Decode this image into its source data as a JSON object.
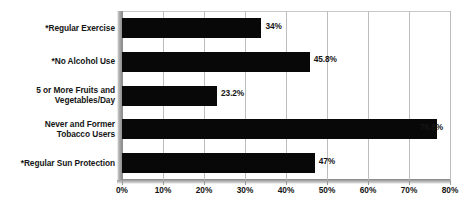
{
  "chart_data": {
    "type": "bar",
    "orientation": "horizontal",
    "title": "",
    "subtitle": "",
    "xlabel": "",
    "ylabel": "",
    "xlim": [
      0,
      80
    ],
    "grid": true,
    "legend": false,
    "legend_position": "none",
    "bar_color": "#080808",
    "gridline_color": "#bdbdbd",
    "axis_color": "#8e8e8e",
    "categories": [
      "*Regular Exercise",
      "*No Alcohol Use",
      "5 or More Fruits and Vegetables/Day",
      "Never and Former Tobacco Users",
      "*Regular Sun Protection"
    ],
    "category_lines": [
      [
        "*Regular Exercise"
      ],
      [
        "*No Alcohol Use"
      ],
      [
        "5 or More Fruits and",
        "Vegetables/Day"
      ],
      [
        "Never and Former",
        "Tobacco Users"
      ],
      [
        "*Regular Sun Protection"
      ]
    ],
    "values": [
      34,
      45.8,
      23.2,
      76.8,
      47
    ],
    "data_labels": [
      "34%",
      "45.8%",
      "23.2%",
      "76.8%",
      "47%"
    ],
    "xticks": [
      0,
      10,
      20,
      30,
      40,
      50,
      60,
      70,
      80
    ],
    "xtick_labels": [
      "0%",
      "10%",
      "20%",
      "30%",
      "40%",
      "50%",
      "60%",
      "70%",
      "80%"
    ]
  }
}
